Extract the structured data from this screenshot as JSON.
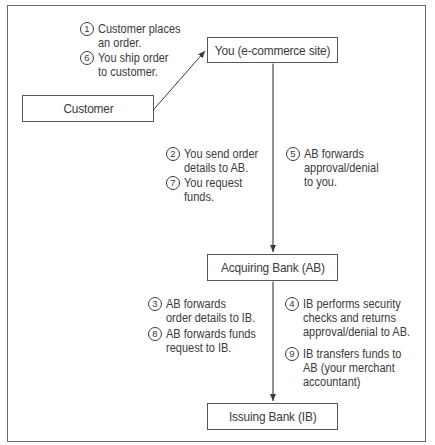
{
  "nodes": {
    "customer": "Customer",
    "you": "You (e-commerce site)",
    "acquiring_bank": "Acquiring Bank (AB)",
    "issuing_bank": "Issuing Bank (IB)"
  },
  "steps": [
    {
      "num": "1",
      "text": "Customer places\nan order."
    },
    {
      "num": "6",
      "text": "You ship order\nto customer."
    },
    {
      "num": "2",
      "text": "You send order\ndetails to AB."
    },
    {
      "num": "7",
      "text": "You request\nfunds."
    },
    {
      "num": "5",
      "text": "AB forwards\napproval/denial\nto you."
    },
    {
      "num": "3",
      "text": "AB forwards\norder details to IB."
    },
    {
      "num": "8",
      "text": "AB forwards funds\nrequest to IB."
    },
    {
      "num": "4",
      "text": "IB performs security\nchecks and returns\napproval/denial to AB."
    },
    {
      "num": "9",
      "text": "IB transfers funds to\nAB (your merchant\naccountant)"
    }
  ],
  "connections": [
    {
      "from": "Customer",
      "to": "You (e-commerce site)",
      "type": "bidirectional-arrow"
    },
    {
      "from": "You (e-commerce site)",
      "to": "Acquiring Bank (AB)",
      "type": "bidirectional-arrow"
    },
    {
      "from": "Acquiring Bank (AB)",
      "to": "Issuing Bank (IB)",
      "type": "bidirectional-arrow"
    }
  ],
  "colors": {
    "border": "#555555",
    "text": "#3a3a3a",
    "background": "#ffffff"
  }
}
